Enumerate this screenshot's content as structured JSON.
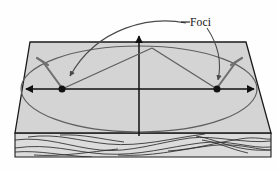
{
  "figure": {
    "background_color": "#fefefe",
    "annotations": [
      {
        "name": "foci-label",
        "text": "Foci",
        "x": 190,
        "y": 22,
        "leader_targets": [
          "left-focus-point",
          "right-focus-point"
        ]
      }
    ]
  },
  "board": {
    "name": "wooden-board",
    "top_face_color": "#d4d4d4",
    "side_face_color": "#d8d8d8",
    "edge_color": "#1a1a1a",
    "top_face_points": "30,42 246,42 271,133 15,133",
    "front_face_points": "15,133 271,133 271,157 15,157",
    "left_edge_points": "30,42 15,133",
    "grain_lines": 9
  },
  "axes": {
    "name": "coordinate-axes",
    "color": "#111111",
    "horizontal": {
      "x1": 22,
      "y1": 89,
      "x2": 258,
      "y2": 89,
      "arrows": "both"
    },
    "vertical": {
      "x1": 139,
      "y1": 136,
      "x2": 139,
      "y2": 34,
      "arrows": "up"
    }
  },
  "ellipse": {
    "name": "ellipse-curve",
    "color": "#5a5a5a",
    "center_x": 139,
    "center_y": 89,
    "semi_major": 118,
    "semi_minor": 43
  },
  "foci": [
    {
      "name": "left-focus-point",
      "x": 62,
      "y": 89,
      "radius": 3.4,
      "color": "#1a1a1a",
      "pin": {
        "name": "left-focus-pin",
        "tip_x": 63,
        "tip_y": 87,
        "head_x": 41,
        "head_y": 61,
        "color": "#6a6a6a"
      }
    },
    {
      "name": "right-focus-point",
      "x": 217,
      "y": 89,
      "radius": 3.4,
      "color": "#1a1a1a",
      "pin": {
        "name": "right-focus-pin",
        "tip_x": 216,
        "tip_y": 87,
        "head_x": 238,
        "head_y": 61,
        "color": "#6a6a6a"
      }
    }
  ],
  "string": {
    "name": "taut-string",
    "color": "#5a5a5a",
    "apex_x": 152,
    "apex_y": 48,
    "from_left": "62,89 152,48",
    "from_right": "217,89 152,48"
  },
  "leaders": [
    {
      "name": "leader-to-left-focus",
      "path": "M 186,24 C 150,20 96,28 70,80",
      "arrow_at": {
        "x": 66,
        "y": 85,
        "angle": 62
      }
    },
    {
      "name": "leader-to-right-focus",
      "path": "M 205,29 C 218,48 222,62 219,80",
      "arrow_at": {
        "x": 218,
        "y": 85,
        "angle": 95
      }
    }
  ]
}
